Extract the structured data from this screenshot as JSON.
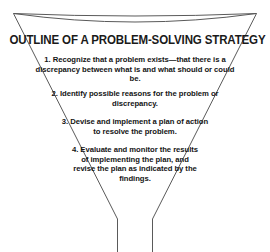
{
  "diagram": {
    "kind": "funnel-diagram",
    "title": "OUTLINE OF A PROBLEM-SOLVING STRATEGY",
    "line_color": "#5a5a5a",
    "text_color": "#141414",
    "background_color": "#ffffff",
    "steps": [
      {
        "number": "1.",
        "text": "1.  Recognize that a problem exists—that there is a discrepancy between what is and what should or could be."
      },
      {
        "number": "2.",
        "text": "2.  Identify possible reasons for the problem or discrepancy."
      },
      {
        "number": "3.",
        "text": "3.  Devise and implement a plan of action to resolve the problem."
      },
      {
        "number": "4.",
        "text": "4.  Evaluate and monitor the results of implementing the plan, and revise the plan as indicated by the findings."
      }
    ]
  }
}
